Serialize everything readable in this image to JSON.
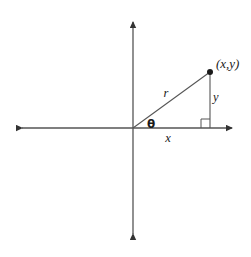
{
  "figure": {
    "type": "geometry-diagram",
    "background_color": "#ffffff",
    "stroke_color": "#555555",
    "label_color": "#1a1a1a"
  },
  "axes": {
    "horizontal": {
      "name": "x-axis",
      "y": 128,
      "x_start": 16,
      "x_end": 238,
      "double_arrow": true
    },
    "vertical": {
      "name": "y-axis",
      "x": 133,
      "y_start": 16,
      "y_end": 240,
      "double_arrow": true
    },
    "origin": {
      "x": 133,
      "y": 128
    }
  },
  "triangle": {
    "vertices": {
      "origin": {
        "x": 133,
        "y": 128
      },
      "point": {
        "x": 210,
        "y": 72
      },
      "foot": {
        "x": 210,
        "y": 128
      }
    },
    "right_angle_marker": {
      "size": 9,
      "x": 201,
      "y": 119
    }
  },
  "labels": {
    "point": "(x,y)",
    "radius": "r",
    "angle": "θ",
    "horizontal_leg": "x",
    "vertical_leg": "y"
  },
  "label_positions": {
    "point": {
      "x": 216,
      "y": 68
    },
    "radius": {
      "x": 166,
      "y": 97
    },
    "angle": {
      "x": 147,
      "y": 128
    },
    "horizontal_leg": {
      "x": 168,
      "y": 142
    },
    "vertical_leg": {
      "x": 213,
      "y": 101
    }
  }
}
